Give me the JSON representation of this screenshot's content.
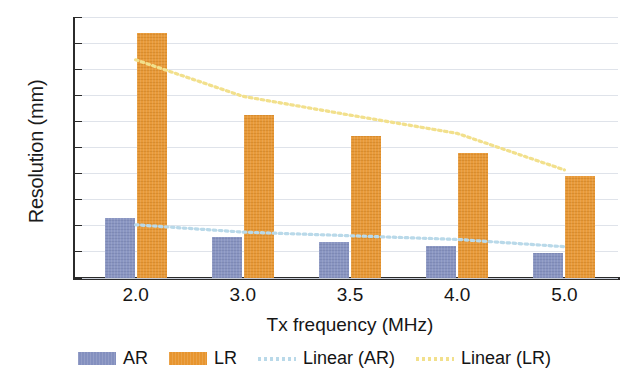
{
  "chart_data": {
    "type": "bar",
    "title": "",
    "xlabel": "Tx frequency (MHz)",
    "ylabel": "Resolution (mm)",
    "categories": [
      "2.0",
      "3.0",
      "3.5",
      "4.0",
      "5.0"
    ],
    "ylim": [
      0.0,
      5.0
    ],
    "ytick_labels": [
      "0.0",
      "0.5",
      "1.0",
      "1.5",
      "2.0",
      "2.5",
      "3.0",
      "3.5",
      "4.0",
      "4.5",
      "5.0"
    ],
    "ytick_values": [
      0.0,
      0.5,
      1.0,
      1.5,
      2.0,
      2.5,
      3.0,
      3.5,
      4.0,
      4.5,
      5.0
    ],
    "grid": true,
    "legend_position": "bottom",
    "series": [
      {
        "name": "AR",
        "type": "bar",
        "color": "#8490bf",
        "values": [
          1.15,
          0.78,
          0.69,
          0.62,
          0.48
        ]
      },
      {
        "name": "LR",
        "type": "bar",
        "color": "#e7952f",
        "values": [
          4.7,
          3.12,
          2.72,
          2.4,
          1.95
        ]
      },
      {
        "name": "Linear (AR)",
        "type": "trendline",
        "color": "#b9d9e9",
        "style": "dotted",
        "values": [
          1.02,
          0.88,
          0.81,
          0.74,
          0.6
        ]
      },
      {
        "name": "Linear (LR)",
        "type": "trendline",
        "color": "#f2e08c",
        "style": "dotted",
        "values": [
          4.18,
          3.48,
          3.12,
          2.77,
          2.07
        ]
      }
    ]
  },
  "axes": {
    "y_title": "Resolution (mm)",
    "x_title": "Tx frequency (MHz)"
  },
  "legend": {
    "items": [
      {
        "label": "AR",
        "marker": "bar-swatch-blue"
      },
      {
        "label": "LR",
        "marker": "bar-swatch-orange"
      },
      {
        "label": "Linear (AR)",
        "marker": "dotted-line-lightblue"
      },
      {
        "label": "Linear (LR)",
        "marker": "dotted-line-yellow"
      }
    ]
  }
}
